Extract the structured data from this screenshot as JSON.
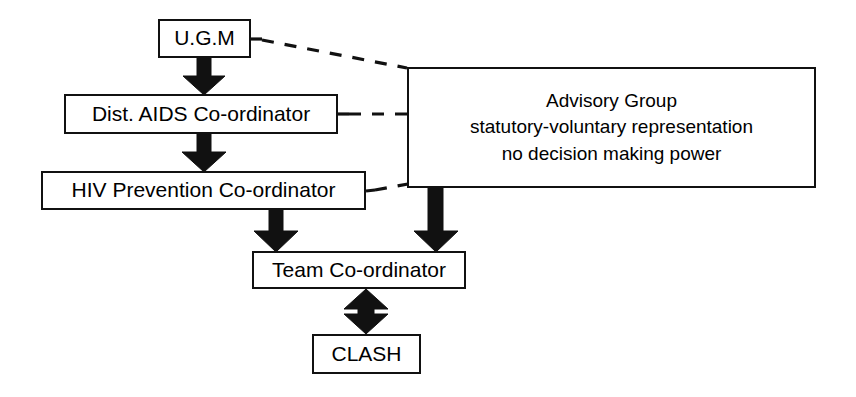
{
  "diagram": {
    "background_color": "#ffffff",
    "line_color": "#111111",
    "nodes": {
      "ugm": {
        "label": "U.G.M"
      },
      "dist_aids_coordinator": {
        "label": "Dist. AIDS Co-ordinator"
      },
      "hiv_prevention_coordinator": {
        "label": "HIV Prevention Co-ordinator"
      },
      "team_coordinator": {
        "label": "Team Co-ordinator"
      },
      "clash": {
        "label": "CLASH"
      },
      "advisory_group": {
        "line1": "Advisory Group",
        "line2": "statutory-voluntary representation",
        "line3": "no decision making power"
      }
    },
    "connectors": [
      {
        "name": "ugm-to-dist-aids",
        "style": "solid-block-arrow",
        "direction": "down"
      },
      {
        "name": "dist-aids-to-hiv-prevention",
        "style": "solid-block-arrow",
        "direction": "down"
      },
      {
        "name": "hiv-prevention-to-team-coordinator",
        "style": "solid-block-arrow",
        "direction": "down"
      },
      {
        "name": "advisory-group-to-team-coordinator",
        "style": "solid-block-arrow",
        "direction": "down"
      },
      {
        "name": "team-coordinator-to-clash",
        "style": "solid-block-arrow",
        "direction": "bidirectional"
      },
      {
        "name": "ugm-to-advisory-group",
        "style": "dashed",
        "direction": "none"
      },
      {
        "name": "dist-aids-to-advisory-group",
        "style": "dashed",
        "direction": "none"
      },
      {
        "name": "hiv-prevention-to-advisory-group",
        "style": "dashed",
        "direction": "none"
      }
    ]
  }
}
